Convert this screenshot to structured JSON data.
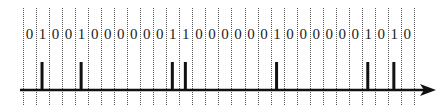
{
  "diagram": {
    "type": "pulse-train",
    "bits": [
      0,
      1,
      0,
      0,
      1,
      0,
      0,
      0,
      0,
      0,
      0,
      1,
      1,
      0,
      0,
      0,
      0,
      0,
      0,
      1,
      0,
      0,
      0,
      0,
      0,
      0,
      1,
      0,
      1,
      0
    ],
    "grid": {
      "x_start": 23,
      "cell_width": 13.03,
      "top": 8,
      "bottom": 106,
      "style": "dotted"
    },
    "axis": {
      "y": 90,
      "x_start": 20,
      "x_end": 436,
      "arrow": "right"
    },
    "pulse": {
      "height": 28,
      "width": 3
    },
    "colors": {
      "line": "#111111",
      "grid": "#555555",
      "text": "#222222",
      "background": "#ffffff"
    }
  }
}
